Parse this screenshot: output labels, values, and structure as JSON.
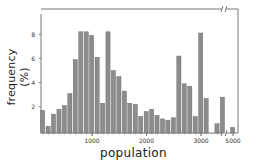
{
  "chart_data": {
    "type": "bar",
    "title": "",
    "xlabel": "population",
    "ylabel": "frequency (%)",
    "ylim": [
      0,
      9.7
    ],
    "yticks": [
      2,
      4,
      6,
      8
    ],
    "xticks": [
      {
        "label": "1000",
        "value": 1000
      },
      {
        "label": "2000",
        "value": 2000
      },
      {
        "label": "3000",
        "value": 3000
      },
      {
        "label": "5000",
        "value": 5000
      }
    ],
    "axis_break": "between 3500 and 5000 (broken x-axis marks)",
    "grid": false,
    "legend": null,
    "bin_width": 100,
    "categories": [
      100,
      200,
      300,
      400,
      500,
      600,
      700,
      800,
      900,
      1000,
      1100,
      1200,
      1300,
      1400,
      1500,
      1600,
      1700,
      1800,
      1900,
      2000,
      2100,
      2200,
      2300,
      2400,
      2500,
      2600,
      2700,
      2800,
      2900,
      3000,
      3100,
      3300,
      3400,
      5000
    ],
    "values": [
      1.7,
      0.4,
      1.4,
      1.8,
      2.1,
      3.1,
      5.9,
      8.2,
      8.2,
      7.9,
      6.1,
      2.3,
      8.2,
      5.0,
      4.5,
      3.3,
      2.3,
      2.2,
      1.2,
      1.6,
      1.8,
      1.3,
      1.0,
      0.9,
      1.1,
      6.2,
      3.9,
      3.7,
      1.2,
      8.1,
      2.7,
      0.6,
      2.8,
      0.3
    ],
    "bar_color": "#8c8c8c"
  },
  "labels": {
    "x": "population",
    "y": "frequency (%)"
  }
}
